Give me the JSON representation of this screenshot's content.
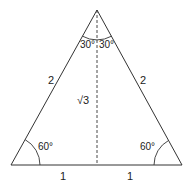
{
  "diagram": {
    "type": "equilateral-triangle-split",
    "colors": {
      "stroke": "#333333",
      "text": "#222222",
      "background": "#ffffff"
    },
    "sides": {
      "left": "2",
      "right": "2",
      "base_left": "1",
      "base_right": "1",
      "altitude": "√3"
    },
    "angles": {
      "apex_left": "30°",
      "apex_right": "30°",
      "base_left": "60°",
      "base_right": "60°"
    },
    "altitude_style": "dashed"
  }
}
